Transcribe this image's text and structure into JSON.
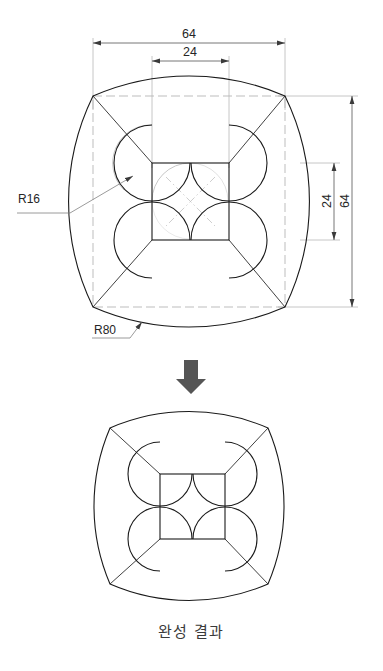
{
  "document": {
    "type": "technical-drawing",
    "title": "",
    "background_color": "#ffffff",
    "line_color": "#1a1a1a",
    "construction_color": "#b9b9b9"
  },
  "dimensions": {
    "top_overall": "64",
    "top_inner": "24",
    "right_overall": "64",
    "right_inner": "24"
  },
  "radii": {
    "fillet_label": "R16",
    "outer_arc_label": "R80"
  },
  "flow": {
    "arrow_icon": "down-arrow-icon"
  },
  "caption": {
    "text": "완성 결과"
  },
  "geometry": {
    "upper_figure": {
      "square_left": 93,
      "square_top": 96,
      "square_right": 285,
      "square_bottom": 307,
      "inner_left": 152,
      "inner_top": 163,
      "inner_right": 229,
      "inner_bottom": 240,
      "lobe_radius": 38,
      "outer_arc_radius": 240
    },
    "lower_figure": {
      "square_left": 110,
      "square_top": 428,
      "square_right": 268,
      "square_bottom": 584,
      "inner_left": 160,
      "inner_top": 474,
      "inner_right": 225,
      "inner_bottom": 539,
      "lobe_radius": 32,
      "outer_arc_radius": 198
    }
  }
}
